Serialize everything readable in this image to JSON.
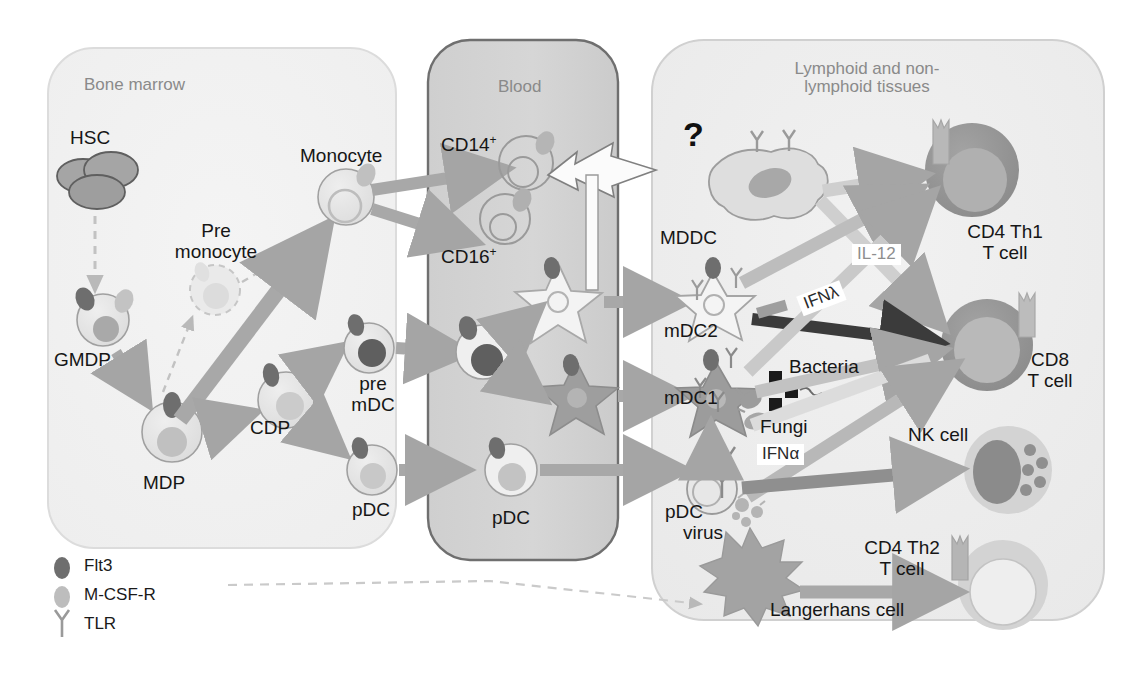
{
  "figure": {
    "type": "diagram"
  },
  "panels": [
    {
      "id": "bone-marrow",
      "title": "Bone marrow",
      "fill": "#f2f2f2",
      "stroke": "#d8d8d8"
    },
    {
      "id": "blood",
      "title": "Blood",
      "fill": "#d2d2d2",
      "stroke": "#6f6f6f"
    },
    {
      "id": "tissues",
      "title_line1": "Lymphoid and non-",
      "title_line2": "lymphoid tissues",
      "fill": "#efefef",
      "stroke": "#cfcfcf"
    }
  ],
  "bone_marrow": {
    "cells": [
      {
        "name": "HSC",
        "label": "HSC"
      },
      {
        "name": "pre-monocyte",
        "label_line1": "Pre",
        "label_line2": "monocyte"
      },
      {
        "name": "monocyte",
        "label": "Monocyte"
      },
      {
        "name": "GMDP",
        "label": "GMDP"
      },
      {
        "name": "MDP",
        "label": "MDP"
      },
      {
        "name": "CDP",
        "label": "CDP"
      },
      {
        "name": "pre-mDC",
        "label_line1": "pre",
        "label_line2": "mDC"
      },
      {
        "name": "pDC",
        "label": "pDC"
      }
    ]
  },
  "blood": {
    "cells": [
      {
        "name": "cd14-monocyte",
        "label": "CD14",
        "sup": "+"
      },
      {
        "name": "cd16-monocyte",
        "label": "CD16",
        "sup": "+"
      },
      {
        "name": "blood-mdc2",
        "label": ""
      },
      {
        "name": "blood-mdc1",
        "label": ""
      },
      {
        "name": "blood-pdc",
        "label": "pDC"
      }
    ]
  },
  "tissues": {
    "unknown_marker": "?",
    "cells": [
      {
        "name": "MDDC",
        "label": "MDDC"
      },
      {
        "name": "mDC2",
        "label": "mDC2"
      },
      {
        "name": "mDC1",
        "label": "mDC1"
      },
      {
        "name": "pDC-virus",
        "label_line1": "pDC",
        "label_line2": "virus"
      },
      {
        "name": "langerhans-cell",
        "label": "Langerhans cell"
      },
      {
        "name": "cd4-th1-t-cell",
        "label_line1": "CD4 Th1",
        "label_line2": "T cell"
      },
      {
        "name": "cd8-t-cell",
        "label_line1": "CD8",
        "label_line2": "T cell"
      },
      {
        "name": "nk-cell",
        "label": "NK cell"
      },
      {
        "name": "cd4-th2-t-cell",
        "label_line1": "CD4 Th2",
        "label_line2": "T cell"
      }
    ],
    "pathogens": [
      {
        "name": "bacteria",
        "label": "Bacteria"
      },
      {
        "name": "fungi",
        "label": "Fungi"
      }
    ],
    "cytokines": [
      {
        "name": "IL-12",
        "label": "IL-12",
        "color": "#8e8e8e"
      },
      {
        "name": "IFN-lambda",
        "label": "IFNλ",
        "color": "#2a2a2a"
      },
      {
        "name": "IFN-alpha",
        "label": "IFNα",
        "color": "#2a2a2a"
      }
    ]
  },
  "legend": {
    "items": [
      {
        "name": "Flt3",
        "label": "Flt3",
        "glyph": "dark-oval",
        "color": "#6e6e6e"
      },
      {
        "name": "M-CSF-R",
        "label": "M-CSF-R",
        "glyph": "light-oval",
        "color": "#bdbdbd"
      },
      {
        "name": "TLR",
        "label": "TLR",
        "glyph": "y-shape",
        "color": "#9a9a9a"
      }
    ]
  },
  "colors": {
    "arrow_gray": "#a8a8a8",
    "arrow_mid": "#9b9b9b",
    "arrow_light": "#cccccc",
    "arrow_dark": "#3b3b3b",
    "cell_outline": "#9a9a9a",
    "flt3_dark": "#6e6e6e",
    "mcsfr_light": "#c3c3c3",
    "nucleus_mid": "#a9a9a9",
    "tcell_dark": "#8e8e8e",
    "text": "#1a1a1a",
    "panel_title": "#8a8a8a"
  }
}
